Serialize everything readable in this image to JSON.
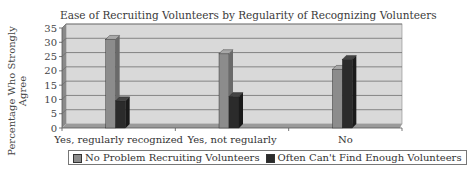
{
  "chart_data": {
    "type": "bar",
    "title": "Ease of Recruiting Volunteers by Regularity of Recognizing Volunteers",
    "xlabel": "",
    "ylabel": "Percentage Who Strongly Agree",
    "ylim": [
      0,
      35
    ],
    "yticks": [
      0,
      5,
      10,
      15,
      20,
      25,
      30,
      35
    ],
    "grid": true,
    "legend_position": "bottom",
    "style": "3d-column",
    "categories": [
      "Yes, regularly recognized",
      "Yes, not regularly",
      "No"
    ],
    "series": [
      {
        "name": "No Problem Recruiting Volunteers",
        "color": "#8c8c8c",
        "values": [
          31,
          26,
          20.5
        ]
      },
      {
        "name": "Often Can't Find Enough Volunteers",
        "color": "#2b2b2b",
        "values": [
          9.5,
          11,
          24
        ]
      }
    ]
  },
  "labels": {
    "title": "Ease of Recruiting Volunteers by Regularity of Recognizing Volunteers",
    "ylabel_line1": "Percentage Who Strongly",
    "ylabel_line2": "Agree",
    "legend_1": "No Problem Recruiting Volunteers",
    "legend_2": "Often Can't Find Enough Volunteers"
  },
  "colors": {
    "plot_bg": "#d9d9d9",
    "wall_side": "#8a8a8a",
    "gridline": "#6f6f6f",
    "series_1": "#8c8c8c",
    "series_2": "#2b2b2b"
  }
}
